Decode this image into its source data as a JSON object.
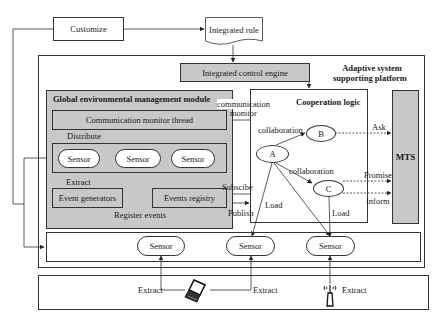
{
  "diagram": {
    "customize": "Customize",
    "integrated_rule": "Integrated rule",
    "platform_title_line1": "Adaptive system",
    "platform_title_line2": "supporting platform",
    "control_engine": "Integrated control engine",
    "global_module": {
      "title": "Global environmental management module",
      "comm_thread": "Communication monitor thread",
      "distribute": "Distribute",
      "sensors": [
        "Sensor",
        "Sensor",
        "Sensor"
      ],
      "extract": "Extract",
      "event_generators": "Event generators",
      "events_registry": "Events registry",
      "register_events": "Register events"
    },
    "comm_monitor_line1": "communication",
    "comm_monitor_line2": "monitor",
    "cooperation": {
      "title": "Cooperation logic",
      "node_a": "A",
      "node_b": "B",
      "node_c": "C",
      "collab_ab": "collaboration",
      "collab_ac": "collaboration",
      "load_left": "Load",
      "load_right": "Load"
    },
    "mts": "MTS",
    "ask": "Ask",
    "promise": "Promise",
    "inform": "Inform",
    "subscribe": "Subscibe",
    "publish": "Publish",
    "bottom_sensors": [
      "Sensor",
      "Sensor",
      "Sensor"
    ],
    "device_extracts": [
      "Extract",
      "Extract",
      "Extract"
    ],
    "devices": [
      "laptop-icon",
      "antenna-device-icon"
    ]
  }
}
